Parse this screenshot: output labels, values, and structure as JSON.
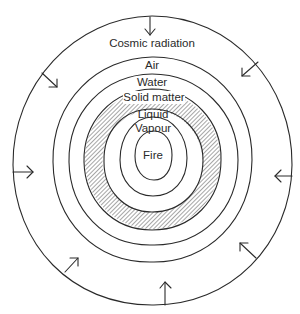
{
  "diagram": {
    "type": "concentric-layers",
    "center": {
      "x": 152.5,
      "y": 160
    },
    "colors": {
      "stroke": "#2a2a2a",
      "background": "#ffffff",
      "hatch": "#3a3a3a"
    },
    "outer_boundary": {
      "rx": 140,
      "ry": 145
    },
    "layers": [
      {
        "id": "cosmic",
        "label": "Cosmic radiation",
        "label_y": 44
      },
      {
        "id": "air",
        "label": "Air",
        "label_y": 65,
        "rx": 100,
        "ry": 102
      },
      {
        "id": "water",
        "label": "Water",
        "label_y": 82,
        "rx": 84,
        "ry": 85
      },
      {
        "id": "solid",
        "label": "Solid matter",
        "label_y": 97,
        "rx_outer": 69,
        "ry_outer": 70,
        "rx_inner": 50,
        "ry_inner": 52,
        "hatched": true
      },
      {
        "id": "liquid",
        "label": "Liquid",
        "label_y": 114,
        "rx": 34,
        "ry": 36
      },
      {
        "id": "vapour",
        "label": "Vapour",
        "label_y": 127,
        "rx": 34,
        "ry": 36
      },
      {
        "id": "fire",
        "label": "Fire",
        "label_y": 155,
        "rx": 18,
        "ry": 24
      }
    ],
    "arrows": [
      {
        "name": "top",
        "from": [
          150,
          17
        ],
        "to": [
          150,
          35
        ]
      },
      {
        "name": "upper-left",
        "from": [
          42,
          73
        ],
        "to": [
          57,
          87
        ]
      },
      {
        "name": "upper-right",
        "from": [
          258,
          62
        ],
        "to": [
          242,
          76
        ]
      },
      {
        "name": "left",
        "from": [
          13,
          172
        ],
        "to": [
          33,
          172
        ]
      },
      {
        "name": "right",
        "from": [
          292,
          176
        ],
        "to": [
          275,
          176
        ]
      },
      {
        "name": "lower-left",
        "from": [
          65,
          272
        ],
        "to": [
          78,
          258
        ]
      },
      {
        "name": "lower-right",
        "from": [
          256,
          258
        ],
        "to": [
          240,
          243
        ]
      },
      {
        "name": "bottom",
        "from": [
          165,
          305
        ],
        "to": [
          165,
          282
        ]
      }
    ]
  },
  "labels": {
    "cosmic": "Cosmic radiation",
    "air": "Air",
    "water": "Water",
    "solid": "Solid matter",
    "liquid": "Liquid",
    "vapour": "Vapour",
    "fire": "Fire"
  }
}
